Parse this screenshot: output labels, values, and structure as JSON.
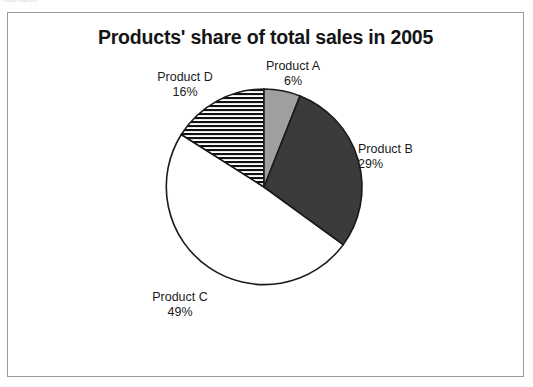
{
  "scan_artifact_text": "Information",
  "chart_data": {
    "type": "pie",
    "title": "Products' share of total sales in 2005",
    "xlabel": "",
    "ylabel": "",
    "grid": false,
    "legend_position": "none",
    "labels_outside": true,
    "start_angle_deg": 0,
    "direction": "clockwise",
    "categories": [
      "Product A",
      "Product B",
      "Product C",
      "Product D"
    ],
    "values": [
      6,
      29,
      49,
      16
    ],
    "value_unit": "%",
    "slices": [
      {
        "name": "Product A",
        "value": 6,
        "value_label": "6%",
        "fill": "#9f9f9f",
        "fill_style": "solid-light-gray",
        "start_deg": 0,
        "end_deg": 21.6
      },
      {
        "name": "Product B",
        "value": 29,
        "value_label": "29%",
        "fill": "#3b3b3b",
        "fill_style": "solid-dark-gray",
        "start_deg": 21.6,
        "end_deg": 126.0
      },
      {
        "name": "Product C",
        "value": 49,
        "value_label": "49%",
        "fill": "#ffffff",
        "fill_style": "solid-white",
        "start_deg": 126.0,
        "end_deg": 302.4
      },
      {
        "name": "Product D",
        "value": 16,
        "value_label": "16%",
        "fill": "#ffffff",
        "fill_style": "horizontal-stripes-black",
        "start_deg": 302.4,
        "end_deg": 360.0
      }
    ],
    "colors": {
      "product_a": "#9f9f9f",
      "product_b": "#3b3b3b",
      "product_c": "#ffffff",
      "product_d_stripe": "#111111",
      "outline": "#1a1a1a",
      "frame": "#9a9a9a",
      "title": "#151515"
    }
  }
}
